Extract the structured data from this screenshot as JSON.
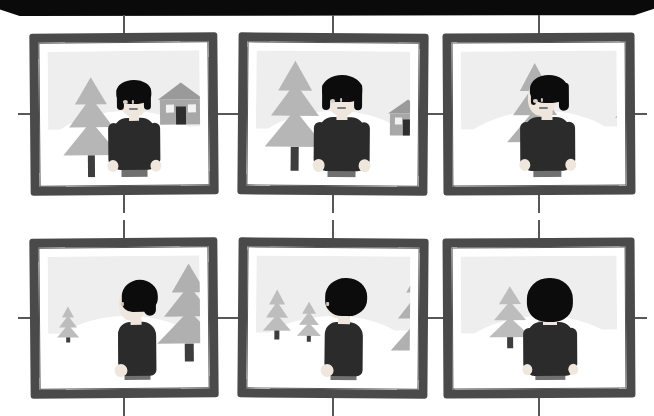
{
  "artwork": {
    "title": "Rotating Figure Storyboard",
    "description": "Six framed illustration panels showing a figure turning from front view to back view in a snowy landscape",
    "panel_count": 6,
    "rows": 2,
    "columns": 3,
    "canvas": {
      "width": 654,
      "height": 413,
      "background": "#ffffff"
    }
  },
  "top_band": {
    "name": "black-header-band",
    "color": "#0a0a0a",
    "height": 16
  },
  "palette": {
    "frame": "#4a4a4a",
    "sky": "#eeeeee",
    "snow": "#ffffff",
    "tree_foliage": "#b4b4b4",
    "tree_trunk": "#3d3d3d",
    "house_wall": "#a8a8a8",
    "house_roof": "#9a9a9a",
    "house_door": "#2e2e2e",
    "figure_hair": "#0c0c0c",
    "figure_coat": "#2b2b2b",
    "figure_skin": "#efe7de",
    "figure_pants": "#707070",
    "tick_mark": "#585858"
  },
  "panels": [
    {
      "id": "panel-1",
      "label": "Panel 1",
      "position": "row-1-col-1",
      "figure_view": "front",
      "figure_rotation_deg": 0,
      "caption": "Figure faces viewer; pine tree at left, house at right",
      "elements": [
        "tree-large-left",
        "house-right",
        "figure-front"
      ]
    },
    {
      "id": "panel-2",
      "label": "Panel 2",
      "position": "row-1-col-2",
      "figure_view": "front-slight-turn",
      "figure_rotation_deg": 15,
      "caption": "Camera shifts; tree grows larger, house recedes right",
      "elements": [
        "tree-large-left",
        "house-right-small",
        "figure-front"
      ]
    },
    {
      "id": "panel-3",
      "label": "Panel 3",
      "position": "row-1-col-3",
      "figure_view": "three-quarter",
      "figure_rotation_deg": 35,
      "caption": "Tree moves behind figure; house clipped at right frame edge",
      "elements": [
        "tree-center",
        "house-edge-clipped",
        "figure-three-quarter"
      ]
    },
    {
      "id": "panel-4",
      "label": "Panel 4",
      "position": "row-2-col-1",
      "figure_view": "profile-left",
      "figure_rotation_deg": 70,
      "caption": "Figure in left profile; large tree behind right, small tree far left",
      "elements": [
        "tree-small-left",
        "tree-large-right",
        "figure-profile"
      ]
    },
    {
      "id": "panel-5",
      "label": "Panel 5",
      "position": "row-2-col-2",
      "figure_view": "three-quarter-back",
      "figure_rotation_deg": 110,
      "caption": "Mostly back of head visible; two small trees left, one large right",
      "elements": [
        "tree-small-left",
        "tree-small-left-2",
        "tree-large-right",
        "figure-back-quarter"
      ]
    },
    {
      "id": "panel-6",
      "label": "Panel 6",
      "position": "row-2-col-3",
      "figure_view": "back",
      "figure_rotation_deg": 180,
      "caption": "Figure fully from behind; two trees at left",
      "elements": [
        "tree-left",
        "tree-left-small",
        "figure-back"
      ]
    }
  ],
  "registration_marks": {
    "name": "crosshair-registration-ticks",
    "count_per_panel": 4,
    "positions": [
      "top-center",
      "bottom-center",
      "left-middle",
      "right-middle"
    ],
    "color": "#585858"
  }
}
